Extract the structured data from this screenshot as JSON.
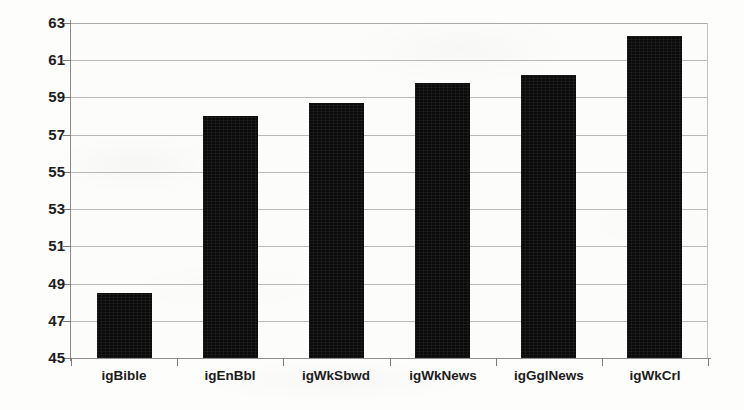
{
  "chart_data": {
    "type": "bar",
    "title": "",
    "subtitle": "",
    "xlabel": "",
    "ylabel": "",
    "categories": [
      "igBible",
      "igEnBbl",
      "igWkSbwd",
      "igWkNews",
      "igGglNews",
      "igWkCrl"
    ],
    "values": [
      48.5,
      58.0,
      58.7,
      59.8,
      60.2,
      62.3
    ],
    "series": [
      {
        "name": "",
        "values": [
          48.5,
          58.0,
          58.7,
          59.8,
          60.2,
          62.3
        ]
      }
    ],
    "ylim": [
      45,
      63
    ],
    "ytick_step": 2,
    "ytick_labels": [
      "63",
      "61",
      "59",
      "57",
      "55",
      "53",
      "51",
      "49",
      "47",
      "45"
    ],
    "ytick_values": [
      63,
      61,
      59,
      57,
      55,
      53,
      51,
      49,
      47,
      45
    ],
    "grid": true,
    "grid_axis": "y",
    "legend": false,
    "legend_position": "none",
    "annotations": [],
    "bar_color": "#0b0b0b",
    "grid_color": "#b9b9b9",
    "axis_color": "#8a8a8a",
    "background_color": "#fcfcfb",
    "text_color": "#1c1c1c"
  }
}
